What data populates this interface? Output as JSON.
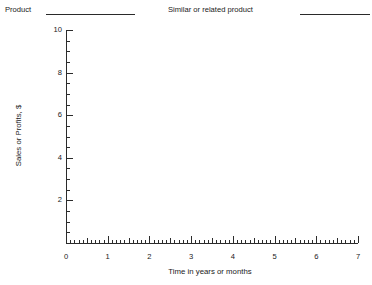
{
  "header": {
    "product_label": "Product",
    "product_value": "",
    "similar_label": "Similar or related product",
    "similar_value": ""
  },
  "chart_data": {
    "type": "line",
    "title": "",
    "xlabel": "Time in years or months",
    "ylabel": "Sales or Profits, $",
    "xlim": [
      0,
      7
    ],
    "ylim": [
      0,
      10
    ],
    "x_major_ticks": [
      0,
      1,
      2,
      3,
      4,
      5,
      6,
      7
    ],
    "x_tick_labels": [
      "0",
      "1",
      "2",
      "3",
      "4",
      "5",
      "6",
      "7"
    ],
    "x_minor_interval": 0.1,
    "y_major_ticks": [
      0,
      2,
      4,
      6,
      8,
      10
    ],
    "y_tick_labels": [
      "0",
      "2",
      "4",
      "6",
      "8",
      "10"
    ],
    "y_minor_interval": 0.5,
    "grid": false,
    "legend": null,
    "series": [],
    "annotations": [],
    "note": "blank worksheet grid; no data plotted"
  },
  "colors": {
    "axis": "#2b2b2b",
    "text": "#1a1a1a",
    "background": "#ffffff"
  }
}
